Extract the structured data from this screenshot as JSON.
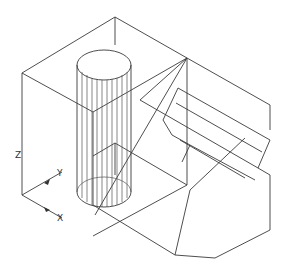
{
  "drawing": {
    "type": "isometric-wireframe",
    "background": "#ffffff",
    "line_color": "#3a3a3a",
    "axes": {
      "z_label": "Z",
      "y_label": "Y",
      "x_label": "X"
    }
  }
}
